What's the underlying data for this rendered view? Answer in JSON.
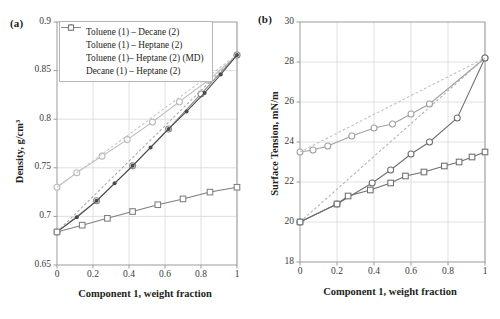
{
  "figure": {
    "panels": [
      {
        "label": "(a)",
        "axis": {
          "xlabel": "Component 1, weight fraction",
          "ylabel": "Density, g/cm³",
          "xticks": [
            "0",
            "0.2",
            "0.4",
            "0.6",
            "0.8",
            "1"
          ],
          "yticks": [
            "0.65",
            "0.70",
            "0.75",
            "0.80",
            "0.85",
            "0.90"
          ]
        }
      },
      {
        "label": "(b)",
        "axis": {
          "xlabel": "Component 1, weight fraction",
          "ylabel": "Surface Tension, mN/m",
          "xticks": [
            "0",
            "0.2",
            "0.4",
            "0.6",
            "0.8",
            "1"
          ],
          "yticks": [
            "18",
            "20",
            "22",
            "24",
            "26",
            "28",
            "30"
          ]
        }
      }
    ],
    "legend": {
      "items": [
        {
          "label": "Toluene (1) – Decane (2)",
          "marker": "open-circle",
          "line": "dotted",
          "color": "#b9b9b9"
        },
        {
          "label": "Toluene (1) – Heptane (2)",
          "marker": "open-circle",
          "line": "solid",
          "color": "#8a8a8a"
        },
        {
          "label": "Toluene (1)– Heptane (2) (MD)",
          "marker": "solid-dot",
          "line": "none",
          "color": "#4a4a4a"
        },
        {
          "label": "Decane (1) – Heptane (2)",
          "marker": "open-square",
          "line": "solid",
          "color": "#7d7d7d"
        }
      ]
    }
  },
  "chart_data": [
    {
      "type": "line",
      "panel": "(a)",
      "title": "Density vs Component 1 weight fraction",
      "xlabel": "Component 1, weight fraction",
      "ylabel": "Density, g/cm³",
      "xlim": [
        0,
        1
      ],
      "ylim": [
        0.65,
        0.9
      ],
      "xticks": [
        0,
        0.2,
        0.4,
        0.6,
        0.8,
        1
      ],
      "yticks": [
        0.65,
        0.7,
        0.75,
        0.8,
        0.85,
        0.9
      ],
      "grid": true,
      "legend_position": "upper-left",
      "series": [
        {
          "name": "Toluene (1) – Decane (2)",
          "style": "solid-with-open-circles",
          "color": "#b9b9b9",
          "x": [
            0.0,
            0.11,
            0.25,
            0.39,
            0.53,
            0.68,
            0.84,
            1.0
          ],
          "y": [
            0.73,
            0.745,
            0.762,
            0.779,
            0.797,
            0.818,
            0.84,
            0.866
          ]
        },
        {
          "name": "Toluene (1) – Decane (2) ideal",
          "style": "dotted-reference",
          "color": "#c6c6c6",
          "x": [
            0.0,
            1.0
          ],
          "y": [
            0.73,
            0.866
          ]
        },
        {
          "name": "Toluene (1) – Heptane (2)",
          "style": "solid-with-open-circles",
          "color": "#8a8a8a",
          "x": [
            0.0,
            0.22,
            0.42,
            0.62,
            0.8,
            1.0
          ],
          "y": [
            0.684,
            0.716,
            0.752,
            0.79,
            0.826,
            0.866
          ]
        },
        {
          "name": "Toluene (1) – Heptane (2) ideal",
          "style": "dotted-reference",
          "color": "#a9a9a9",
          "x": [
            0.0,
            1.0
          ],
          "y": [
            0.684,
            0.866
          ]
        },
        {
          "name": "Toluene (1)– Heptane (2) (MD)",
          "style": "solid-with-solid-dots",
          "color": "#4a4a4a",
          "x": [
            0.0,
            0.11,
            0.22,
            0.32,
            0.42,
            0.52,
            0.62,
            0.72,
            0.82,
            0.91,
            1.0
          ],
          "y": [
            0.684,
            0.699,
            0.716,
            0.734,
            0.752,
            0.771,
            0.79,
            0.808,
            0.827,
            0.846,
            0.866
          ]
        },
        {
          "name": "Decane (1) – Heptane (2)",
          "style": "solid-with-open-squares",
          "color": "#7d7d7d",
          "x": [
            0.0,
            0.14,
            0.28,
            0.42,
            0.56,
            0.7,
            0.85,
            1.0
          ],
          "y": [
            0.684,
            0.691,
            0.698,
            0.705,
            0.712,
            0.718,
            0.725,
            0.73
          ]
        }
      ]
    },
    {
      "type": "line",
      "panel": "(b)",
      "title": "Surface Tension vs Component 1 weight fraction",
      "xlabel": "Component 1, weight fraction",
      "ylabel": "Surface Tension, mN/m",
      "xlim": [
        0,
        1
      ],
      "ylim": [
        18,
        30
      ],
      "xticks": [
        0,
        0.2,
        0.4,
        0.6,
        0.8,
        1
      ],
      "yticks": [
        18,
        20,
        22,
        24,
        26,
        28,
        30
      ],
      "grid": true,
      "legend_position": "none",
      "series": [
        {
          "name": "Toluene (1) – Decane (2)",
          "style": "solid-with-open-circles",
          "color": "#a0a0a0",
          "x": [
            0.0,
            0.07,
            0.15,
            0.28,
            0.4,
            0.5,
            0.6,
            0.7,
            1.0
          ],
          "y": [
            23.5,
            23.6,
            23.8,
            24.3,
            24.7,
            24.9,
            25.4,
            25.9,
            28.2
          ]
        },
        {
          "name": "Toluene (1) – Decane (2) ideal",
          "style": "dotted-reference",
          "color": "#bdbdbd",
          "x": [
            0.0,
            1.0
          ],
          "y": [
            23.5,
            28.2
          ]
        },
        {
          "name": "Toluene (1) – Heptane (2)",
          "style": "solid-with-open-circles",
          "color": "#6e6e6e",
          "x": [
            0.0,
            0.2,
            0.39,
            0.49,
            0.6,
            0.7,
            0.85,
            1.0
          ],
          "y": [
            20.0,
            20.9,
            21.95,
            22.6,
            23.4,
            24.0,
            25.2,
            28.2
          ]
        },
        {
          "name": "Toluene (1) – Heptane (2) ideal",
          "style": "dotted-reference",
          "color": "#b0b0b0",
          "x": [
            0.0,
            1.0
          ],
          "y": [
            20.0,
            28.2
          ]
        },
        {
          "name": "Decane (1) – Heptane (2)",
          "style": "solid-with-open-squares",
          "color": "#6e6e6e",
          "x": [
            0.0,
            0.2,
            0.26,
            0.38,
            0.49,
            0.57,
            0.67,
            0.78,
            0.86,
            0.93,
            1.0
          ],
          "y": [
            20.0,
            20.9,
            21.3,
            21.6,
            21.95,
            22.3,
            22.5,
            22.8,
            23.0,
            23.25,
            23.5
          ]
        }
      ]
    }
  ]
}
